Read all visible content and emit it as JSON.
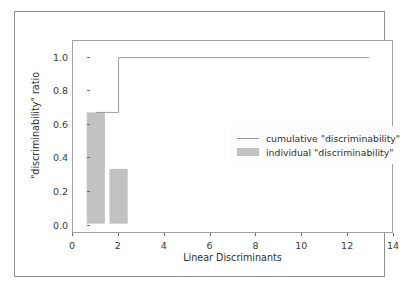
{
  "chart_data": {
    "type": "bar",
    "title": "",
    "xlabel": "Linear Discriminants",
    "ylabel": "\"discriminability\" ratio",
    "xlim": [
      0,
      14
    ],
    "ylim": [
      -0.05,
      1.1
    ],
    "xticks": [
      "0",
      "2",
      "4",
      "6",
      "8",
      "10",
      "12",
      "14"
    ],
    "xtick_values": [
      0,
      2,
      4,
      6,
      8,
      10,
      12,
      14
    ],
    "yticks": [
      "0.0",
      "0.2",
      "0.4",
      "0.6",
      "0.8",
      "1.0"
    ],
    "ytick_values": [
      0.0,
      0.2,
      0.4,
      0.6,
      0.8,
      1.0
    ],
    "grid": false,
    "legend_position": "center right",
    "bar_color": "#c2c2c2",
    "line_color": "#9a9a9a",
    "categories": [
      1,
      2
    ],
    "series": [
      {
        "name": "individual \"discriminability\"",
        "type": "bar",
        "x": [
          1,
          2
        ],
        "values": [
          0.67,
          0.33
        ],
        "bar_width": 0.8
      },
      {
        "name": "cumulative \"discriminability\"",
        "type": "step",
        "x": [
          1,
          2,
          13
        ],
        "values": [
          0.67,
          1.0,
          1.0
        ]
      }
    ],
    "legend": [
      {
        "label": "cumulative \"discriminability\"",
        "marker": "line",
        "color": "#9a9a9a"
      },
      {
        "label": "individual \"discriminability\"",
        "marker": "patch",
        "color": "#c2c2c2"
      }
    ]
  }
}
